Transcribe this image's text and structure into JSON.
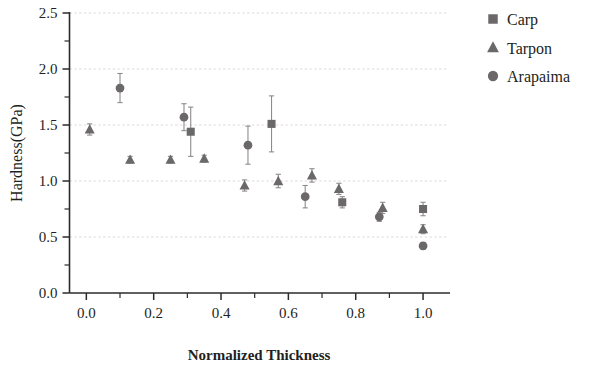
{
  "chart_data": {
    "type": "scatter",
    "title": "",
    "xlabel": "Normalized Thickness",
    "ylabel": "Hardness(GPa)",
    "xlim": [
      -0.05,
      1.08
    ],
    "ylim": [
      0.0,
      2.5
    ],
    "xticks": [
      "0.0",
      "0.2",
      "0.4",
      "0.6",
      "0.8",
      "1.0"
    ],
    "xtick_values": [
      0.0,
      0.2,
      0.4,
      0.6,
      0.8,
      1.0
    ],
    "yticks": [
      "0.0",
      "0.5",
      "1.0",
      "1.5",
      "2.0",
      "2.5"
    ],
    "ytick_values": [
      0.0,
      0.5,
      1.0,
      1.5,
      2.0,
      2.5
    ],
    "minor_ticks": true,
    "grid": "horizontal-dashed",
    "legend_position": "top-right-outside",
    "marker_color": "#6b6869",
    "errorbar_color": "#8e8b8b",
    "series": [
      {
        "name": "Carp",
        "marker": "square",
        "points": [
          {
            "x": 0.31,
            "y": 1.44,
            "err": 0.22
          },
          {
            "x": 0.55,
            "y": 1.51,
            "err": 0.25
          },
          {
            "x": 0.76,
            "y": 0.81,
            "err": 0.05
          },
          {
            "x": 1.0,
            "y": 0.75,
            "err": 0.06
          }
        ]
      },
      {
        "name": "Tarpon",
        "marker": "triangle",
        "points": [
          {
            "x": 0.01,
            "y": 1.46,
            "err": 0.05
          },
          {
            "x": 0.13,
            "y": 1.19,
            "err": 0.03
          },
          {
            "x": 0.25,
            "y": 1.19,
            "err": 0.03
          },
          {
            "x": 0.35,
            "y": 1.2,
            "err": 0.03
          },
          {
            "x": 0.47,
            "y": 0.96,
            "err": 0.05
          },
          {
            "x": 0.57,
            "y": 1.0,
            "err": 0.06
          },
          {
            "x": 0.67,
            "y": 1.05,
            "err": 0.06
          },
          {
            "x": 0.75,
            "y": 0.93,
            "err": 0.05
          },
          {
            "x": 0.88,
            "y": 0.76,
            "err": 0.05
          },
          {
            "x": 1.0,
            "y": 0.57,
            "err": 0.04
          }
        ]
      },
      {
        "name": "Arapaima",
        "marker": "circle",
        "points": [
          {
            "x": 0.1,
            "y": 1.83,
            "err": 0.13
          },
          {
            "x": 0.29,
            "y": 1.57,
            "err": 0.12
          },
          {
            "x": 0.48,
            "y": 1.32,
            "err": 0.17
          },
          {
            "x": 0.65,
            "y": 0.86,
            "err": 0.1
          },
          {
            "x": 0.87,
            "y": 0.68,
            "err": 0.04
          },
          {
            "x": 1.0,
            "y": 0.42,
            "err": 0.03
          }
        ]
      }
    ]
  },
  "legend": {
    "items": [
      {
        "label": "Carp",
        "marker": "square"
      },
      {
        "label": "Tarpon",
        "marker": "triangle"
      },
      {
        "label": "Arapaima",
        "marker": "circle"
      }
    ]
  }
}
